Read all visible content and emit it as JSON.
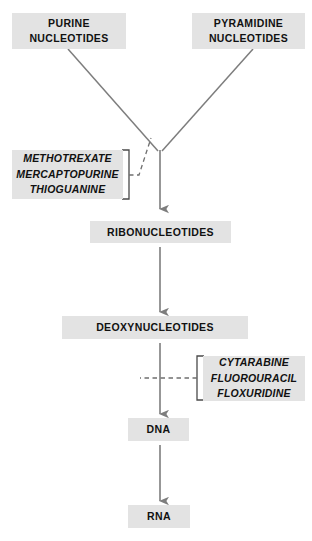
{
  "diagram": {
    "type": "flowchart",
    "colors": {
      "node_fill": "#e3e3e3",
      "text": "#111111",
      "edge": "#7d7d7d",
      "background": "#ffffff"
    },
    "nodes": {
      "purine": {
        "lines": [
          "PURINE",
          "NUCLEOTIDES"
        ]
      },
      "pyrimidine": {
        "lines": [
          "PYRAMIDINE",
          "NUCLEOTIDES"
        ]
      },
      "drugs_upper": {
        "lines": [
          "METHOTREXATE",
          "MERCAPTOPURINE",
          "THIOGUANINE"
        ]
      },
      "ribonucleotides": {
        "lines": [
          "RIBONUCLEOTIDES"
        ]
      },
      "deoxynucleotides": {
        "lines": [
          "DEOXYNUCLEOTIDES"
        ]
      },
      "drugs_lower": {
        "lines": [
          "CYTARABINE",
          "FLUOROURACIL",
          "FLOXURIDINE"
        ]
      },
      "dna": {
        "lines": [
          "DNA"
        ]
      },
      "rna": {
        "lines": [
          "RNA"
        ]
      }
    },
    "edges": [
      {
        "from": "purine",
        "to": "junction",
        "style": "solid",
        "arrow": false
      },
      {
        "from": "pyrimidine",
        "to": "junction",
        "style": "solid",
        "arrow": false
      },
      {
        "from": "junction",
        "to": "ribonucleotides",
        "style": "solid",
        "arrow": true
      },
      {
        "from": "ribonucleotides",
        "to": "deoxynucleotides",
        "style": "solid",
        "arrow": true
      },
      {
        "from": "deoxynucleotides",
        "to": "dna",
        "style": "solid",
        "arrow": true
      },
      {
        "from": "dna",
        "to": "rna",
        "style": "solid",
        "arrow": true
      },
      {
        "from": "drugs_upper",
        "to": "purine-pyrimidine-branch",
        "style": "dashed",
        "arrow": false
      },
      {
        "from": "drugs_lower",
        "to": "deoxynucleotides-dna-arrow",
        "style": "dashed",
        "arrow": false
      }
    ]
  }
}
